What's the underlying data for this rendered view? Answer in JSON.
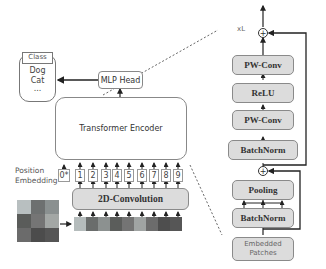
{
  "left": {
    "class_box": {
      "title": "Class",
      "items": [
        "Dog",
        "Cat",
        "..."
      ]
    },
    "mlp_head": "MLP Head",
    "transformer_encoder": "Transformer Encoder",
    "position_embedding": [
      "Position",
      "Embedding"
    ],
    "tokens": [
      "0*",
      "1",
      "2",
      "3",
      "4",
      "5",
      "6",
      "7",
      "8",
      "9"
    ],
    "conv": "2D-Convolution"
  },
  "right": {
    "repeat_label": "xL",
    "blocks": {
      "pw_conv_top": "PW-Conv",
      "relu": "ReLU",
      "pw_conv_bottom": "PW-Conv",
      "batchnorm_mid": "BatchNorm",
      "pooling": "Pooling",
      "batchnorm_bottom": "BatchNorm"
    },
    "input": [
      "Embedded",
      "Patches"
    ],
    "add_symbol": "+"
  },
  "colors": {
    "block_fill": "#dcdcdc",
    "panel_fill": "#ececec",
    "stroke": "#222222"
  }
}
